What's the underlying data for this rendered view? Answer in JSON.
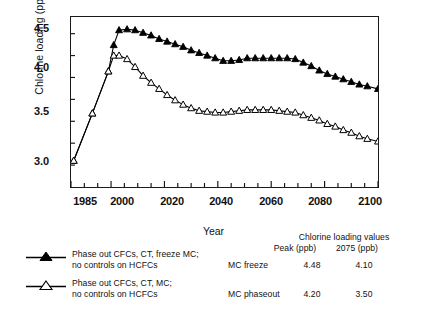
{
  "chart_data": {
    "type": "line",
    "title": "",
    "xlabel": "Year",
    "ylabel": "Chlorine loading (ppb)",
    "xlim": [
      1985,
      2100
    ],
    "ylim": [
      2.68,
      4.62
    ],
    "xticks": [
      1985,
      2000,
      2020,
      2040,
      2060,
      2080,
      2100
    ],
    "xtick_labels": [
      "1985",
      "2000",
      "2020",
      "2040",
      "2060",
      "2080",
      "2100"
    ],
    "xminor_step": 5,
    "yticks": [
      3.0,
      3.5,
      4.0,
      4.5
    ],
    "ytick_labels": [
      "3.0",
      "3.5",
      "4.0",
      "4.5"
    ],
    "yminor_step": 0.25,
    "grid": false,
    "legend_position": "below-left",
    "series": [
      {
        "name": "Phase out CFCs, CT, freeze MC; no controls on HCFCs",
        "short_name": "MC freeze",
        "marker": "filled-triangle",
        "color": "#000000",
        "x": [
          1986,
          1993,
          1999,
          2001,
          2003,
          2006,
          2009,
          2012,
          2015,
          2018,
          2021,
          2024,
          2027,
          2030,
          2033,
          2036,
          2039,
          2042,
          2045,
          2048,
          2051,
          2054,
          2057,
          2060,
          2063,
          2066,
          2069,
          2072,
          2075,
          2078,
          2081,
          2084,
          2087,
          2090,
          2093,
          2096,
          2100
        ],
        "y": [
          2.98,
          3.52,
          4.0,
          4.3,
          4.47,
          4.48,
          4.47,
          4.44,
          4.41,
          4.37,
          4.34,
          4.31,
          4.28,
          4.24,
          4.21,
          4.18,
          4.15,
          4.12,
          4.12,
          4.13,
          4.15,
          4.15,
          4.15,
          4.15,
          4.15,
          4.15,
          4.14,
          4.1,
          4.06,
          4.01,
          3.97,
          3.94,
          3.91,
          3.88,
          3.85,
          3.83,
          3.8
        ]
      },
      {
        "name": "Phase out CFCs, CT, MC; no controls on HCFCs",
        "short_name": "MC phaseout",
        "marker": "open-triangle",
        "color": "#000000",
        "x": [
          1986,
          1993,
          1999,
          2001,
          2003,
          2006,
          2009,
          2012,
          2015,
          2018,
          2021,
          2024,
          2027,
          2030,
          2033,
          2036,
          2039,
          2042,
          2045,
          2048,
          2051,
          2054,
          2057,
          2060,
          2063,
          2066,
          2069,
          2072,
          2075,
          2078,
          2081,
          2084,
          2087,
          2090,
          2093,
          2096,
          2100
        ],
        "y": [
          2.98,
          3.52,
          4.0,
          4.18,
          4.18,
          4.14,
          4.05,
          3.95,
          3.87,
          3.8,
          3.73,
          3.67,
          3.62,
          3.58,
          3.55,
          3.54,
          3.53,
          3.53,
          3.54,
          3.55,
          3.56,
          3.56,
          3.56,
          3.56,
          3.55,
          3.54,
          3.53,
          3.5,
          3.47,
          3.44,
          3.4,
          3.37,
          3.33,
          3.3,
          3.26,
          3.23,
          3.2
        ]
      }
    ]
  },
  "axis": {
    "y_title": "Chlorine loading (ppb)",
    "x_title": "Year"
  },
  "legend": {
    "items": [
      {
        "marker": "filled-triangle",
        "line1": "Phase out CFCs, CT, freeze MC;",
        "line2": "no controls on HCFCs"
      },
      {
        "marker": "open-triangle",
        "line1": "Phase out CFCs, CT, MC;",
        "line2": "no controls on HCFCs"
      }
    ]
  },
  "values_table": {
    "title": "Chlorine loading values",
    "col_peak": "Peak (ppb)",
    "col_2075": "2075 (ppb)",
    "rows": [
      {
        "scenario": "MC freeze",
        "peak": "4.48",
        "y2075": "4.10"
      },
      {
        "scenario": "MC phaseout",
        "peak": "4.20",
        "y2075": "3.50"
      }
    ]
  },
  "caption": {
    "text": ""
  }
}
